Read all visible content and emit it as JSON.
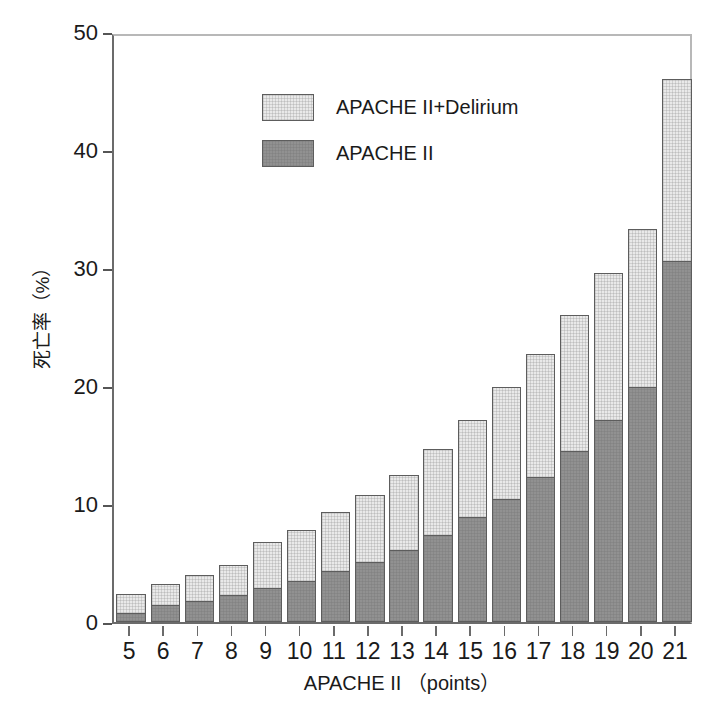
{
  "chart_data": {
    "type": "bar",
    "title": "",
    "subtitle": "",
    "xlabel": "APACHE II （points）",
    "ylabel": "死亡率（%）",
    "categories": [
      "5",
      "6",
      "7",
      "8",
      "9",
      "10",
      "11",
      "12",
      "13",
      "14",
      "15",
      "16",
      "17",
      "18",
      "19",
      "20",
      "21"
    ],
    "series": [
      {
        "name": "APACHE II",
        "color": "#919191",
        "values": [
          0.8,
          1.4,
          1.8,
          2.3,
          2.9,
          3.5,
          4.3,
          5.1,
          6.1,
          7.4,
          8.9,
          10.4,
          12.3,
          14.5,
          17.1,
          19.9,
          30.6
        ]
      },
      {
        "name": "APACHE II+Delirium",
        "color": "#e9e9e9",
        "values": [
          1.6,
          1.8,
          2.2,
          2.5,
          3.9,
          4.3,
          5.0,
          5.7,
          6.4,
          7.3,
          8.2,
          9.5,
          10.4,
          11.5,
          12.5,
          13.4,
          15.4
        ]
      }
    ],
    "totals": [
      2.4,
      3.2,
      4.0,
      4.8,
      6.8,
      7.8,
      9.3,
      10.8,
      12.5,
      14.7,
      17.1,
      19.9,
      22.7,
      26.0,
      29.6,
      33.3,
      46.0
    ],
    "stacked": true,
    "ylim": [
      0,
      50
    ],
    "y_ticks": [
      "0",
      "10",
      "20",
      "30",
      "40",
      "50"
    ],
    "y_tick_values": [
      0,
      10,
      20,
      30,
      40,
      50
    ],
    "grid": false,
    "legend_position": "top-left",
    "legend": [
      {
        "label": "APACHE II+Delirium",
        "swatch": "light-gray-hatched"
      },
      {
        "label": "APACHE II",
        "swatch": "dark-gray-hatched"
      }
    ]
  },
  "axes": {
    "y_title": "死亡率（%）",
    "x_title": "APACHE II （points）"
  },
  "caption": {
    "text": ""
  },
  "colors": {
    "bar_dark": "#919191",
    "bar_light": "#e9e9e9",
    "bar_outline": "#5d5d5d",
    "axis": "#6b6b6b",
    "text": "#1a1a1a"
  }
}
